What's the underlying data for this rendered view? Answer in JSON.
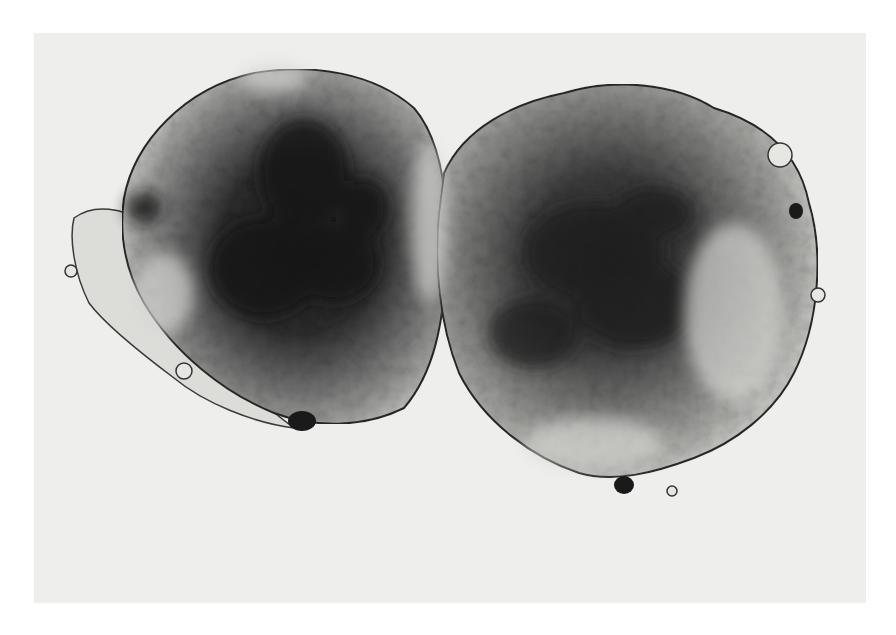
{
  "image": {
    "subject": "Two adjoining cell spheroids (micrograph, grayscale)",
    "background_color": "#eeeeec",
    "margin_color": "#ffffff",
    "colors": {
      "dark_core": "#1c1c1c",
      "mid_tone": "#6a6a6a",
      "light_rim": "#c9c9c6",
      "outline": "#2a2a2a"
    },
    "objects": [
      {
        "name": "left-spheroid",
        "center": [
          300,
          240
        ],
        "approx_size": [
          370,
          370
        ]
      },
      {
        "name": "right-spheroid",
        "center": [
          625,
          285
        ],
        "approx_size": [
          380,
          420
        ]
      }
    ]
  }
}
